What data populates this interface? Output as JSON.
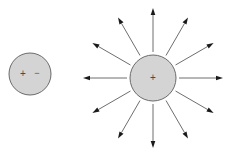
{
  "figure": {
    "width": 234,
    "height": 163,
    "background_color": "#ffffff"
  },
  "colors": {
    "sphere_fill": "#d4d4d4",
    "sphere_stroke": "#6b6b6b",
    "arrow_stroke": "#6e6e6e",
    "arrow_head_fill": "#1a1a1a",
    "glyph_color": "#4a4a4a"
  },
  "objects": {
    "left_sphere": {
      "name": "small-charged-sphere",
      "cx": 30,
      "cy": 74,
      "r": 21,
      "fill": "#d4d4d4",
      "stroke": "#6b6b6b",
      "stroke_width": 1,
      "labels": [
        {
          "text": "+",
          "dx": -7,
          "dy": 0,
          "font_size": 10
        },
        {
          "text": "−",
          "dx": 7,
          "dy": 0,
          "font_size": 9
        }
      ]
    },
    "right_sphere": {
      "name": "large-charged-sphere",
      "cx": 153,
      "cy": 78,
      "r": 23,
      "fill": "#d4d4d4",
      "stroke": "#6b6b6b",
      "stroke_width": 1,
      "labels": [
        {
          "text": "+",
          "dx": 0,
          "dy": 0,
          "font_size": 10
        }
      ]
    }
  },
  "field": {
    "name": "radial-electric-field",
    "origin_x": 153,
    "origin_y": 78,
    "inner_radius": 26,
    "outer_radius": 70,
    "count": 12,
    "angle_step_deg": 30,
    "stroke_width": 1,
    "head_length": 7,
    "head_width": 4.6,
    "arrows": [
      {
        "id": "arrow-e",
        "label": "0° right",
        "angle_deg": 0
      },
      {
        "id": "arrow-ene",
        "label": "30° up-right",
        "angle_deg": 30
      },
      {
        "id": "arrow-nne",
        "label": "60° up-right",
        "angle_deg": 60
      },
      {
        "id": "arrow-n",
        "label": "90° up",
        "angle_deg": 90
      },
      {
        "id": "arrow-nnw",
        "label": "120° up-left",
        "angle_deg": 120
      },
      {
        "id": "arrow-wnw",
        "label": "150° up-left",
        "angle_deg": 150
      },
      {
        "id": "arrow-w",
        "label": "180° left",
        "angle_deg": 180
      },
      {
        "id": "arrow-wsw",
        "label": "210° down-left",
        "angle_deg": 210
      },
      {
        "id": "arrow-ssw",
        "label": "240° down-left",
        "angle_deg": 240
      },
      {
        "id": "arrow-s",
        "label": "270° down",
        "angle_deg": 270
      },
      {
        "id": "arrow-sse",
        "label": "300° down-right",
        "angle_deg": 300
      },
      {
        "id": "arrow-ese",
        "label": "330° down-right",
        "angle_deg": 330
      }
    ]
  }
}
